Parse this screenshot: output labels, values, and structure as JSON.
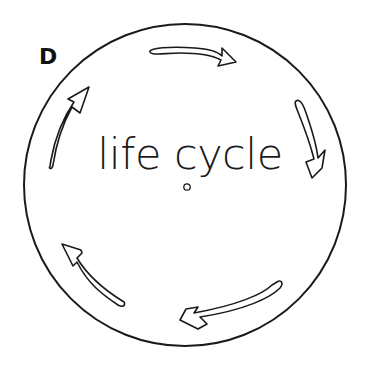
{
  "figure": {
    "panel_label": "D",
    "center_text": "life cycle",
    "colors": {
      "stroke": "#1a1a1a",
      "background": "#ffffff"
    },
    "arrows": [
      {
        "position": "top",
        "direction": "right"
      },
      {
        "position": "upper-right",
        "direction": "down"
      },
      {
        "position": "bottom-right",
        "direction": "left"
      },
      {
        "position": "lower-left",
        "direction": "up-left"
      },
      {
        "position": "upper-left",
        "direction": "up"
      }
    ]
  }
}
